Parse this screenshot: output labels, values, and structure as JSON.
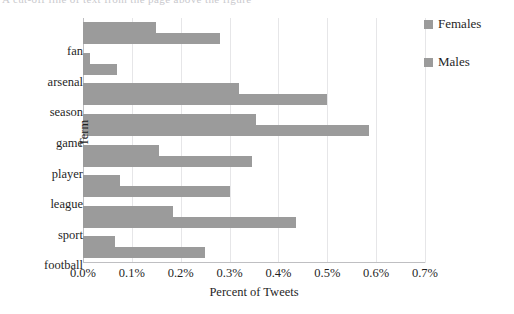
{
  "top_cut_text": "A cut-off line of text from the page above the figure",
  "chart_data": {
    "type": "bar",
    "orientation": "horizontal",
    "title": "",
    "xlabel": "Percent of Tweets",
    "ylabel": "Term",
    "categories": [
      "fan",
      "arsenal",
      "season",
      "game",
      "player",
      "league",
      "sport",
      "football"
    ],
    "series": [
      {
        "name": "Females",
        "color": "#9b9b9b",
        "values": [
          0.15,
          0.015,
          0.32,
          0.355,
          0.155,
          0.075,
          0.185,
          0.065
        ]
      },
      {
        "name": "Males",
        "color": "#9b9b9b",
        "values": [
          0.28,
          0.07,
          0.5,
          0.585,
          0.345,
          0.3,
          0.435,
          0.25
        ]
      }
    ],
    "xlim": [
      0.0,
      0.7
    ],
    "xtick_values": [
      0.0,
      0.1,
      0.2,
      0.3,
      0.4,
      0.5,
      0.6,
      0.7
    ],
    "xtick_labels": [
      "0.0%",
      "0.1%",
      "0.2%",
      "0.3%",
      "0.4%",
      "0.5%",
      "0.6%",
      "0.7%"
    ],
    "grid": "vertical",
    "legend_position": "right",
    "unit": "percent"
  },
  "legend": {
    "items": [
      {
        "label": "Females",
        "color": "#9b9b9b"
      },
      {
        "label": "Males",
        "color": "#9b9b9b"
      }
    ]
  }
}
